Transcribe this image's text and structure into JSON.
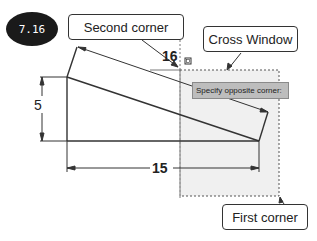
{
  "figure": {
    "badge": "7.16",
    "callouts": {
      "second_corner": "Second corner",
      "cross_window": "Cross Window",
      "first_corner": "First corner"
    },
    "tooltip": "Specify opposite corner:",
    "dimensions": {
      "vertical": "5",
      "horizontal": "15",
      "angled": "16"
    },
    "colors": {
      "window_fill": "#f0f0f0",
      "line": "#333333",
      "tooltip_bg": "#bdbdbd",
      "badge_bg": "#1a1a1a"
    }
  }
}
